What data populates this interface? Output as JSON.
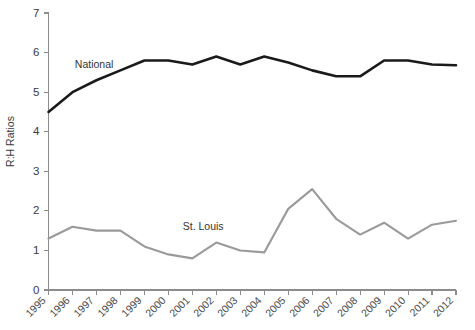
{
  "chart_data": {
    "type": "line",
    "title": "",
    "xlabel": "",
    "ylabel": "R:H Ratios",
    "ylim": [
      0,
      7
    ],
    "yticks": [
      0,
      1,
      2,
      3,
      4,
      5,
      6,
      7
    ],
    "grid": false,
    "legend_position": "inline-annotation",
    "categories": [
      "1995",
      "1996",
      "1997",
      "1998",
      "1999",
      "2000",
      "2001",
      "2002",
      "2003",
      "2004",
      "2005",
      "2006",
      "2007",
      "2008",
      "2009",
      "2010",
      "2011",
      "2012"
    ],
    "series": [
      {
        "name": "National",
        "color": "#1a1a1a",
        "values": [
          4.5,
          5.0,
          5.3,
          5.55,
          5.8,
          5.8,
          5.7,
          5.9,
          5.7,
          5.9,
          5.75,
          5.55,
          5.4,
          5.4,
          5.8,
          5.8,
          5.7,
          5.68
        ],
        "annotation": {
          "label": "National",
          "x_index": 1.1,
          "y_value": 5.62
        }
      },
      {
        "name": "St. Louis",
        "color": "#9a9a9a",
        "values": [
          1.3,
          1.6,
          1.5,
          1.5,
          1.1,
          0.9,
          0.8,
          1.2,
          1.0,
          0.95,
          2.05,
          2.55,
          1.8,
          1.4,
          1.7,
          1.3,
          1.65,
          1.75
        ],
        "annotation": {
          "label": "St. Louis",
          "x_index": 5.6,
          "y_value": 1.52
        }
      }
    ]
  },
  "axis": {
    "y_title": "R:H Ratios"
  }
}
